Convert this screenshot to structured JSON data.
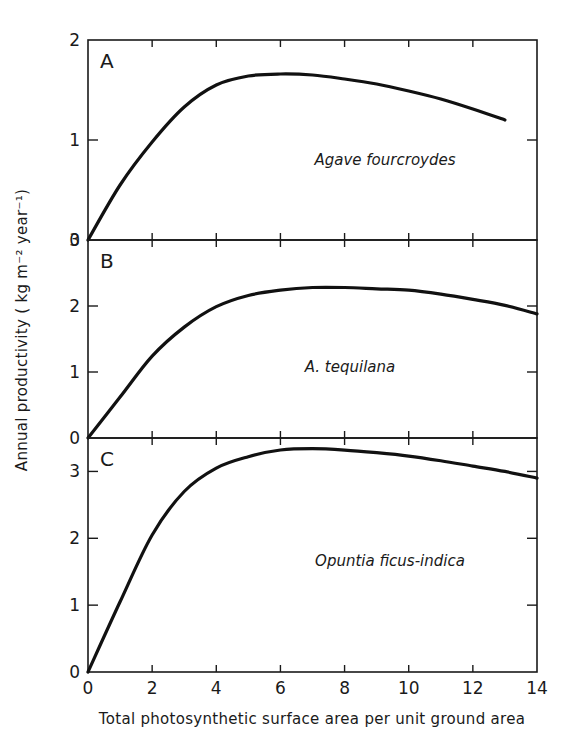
{
  "chart_data": [
    {
      "type": "line",
      "panel": "A",
      "title": "",
      "annotation": "Agave fourcroydes",
      "xlabel": "Total photosynthetic surface area per unit ground area",
      "ylabel": "Annual productivity (kg m^-2 year^-1)",
      "xlim": [
        0,
        14
      ],
      "ylim": [
        0,
        2
      ],
      "yticks": [
        0,
        1,
        2
      ],
      "x": [
        0,
        1,
        2,
        3,
        4,
        5,
        6,
        7,
        8,
        9,
        10,
        11,
        12,
        13
      ],
      "series": [
        {
          "name": "Agave fourcroydes",
          "values": [
            0,
            0.55,
            0.98,
            1.33,
            1.55,
            1.64,
            1.66,
            1.65,
            1.61,
            1.56,
            1.49,
            1.41,
            1.31,
            1.2
          ]
        }
      ]
    },
    {
      "type": "line",
      "panel": "B",
      "title": "",
      "annotation": "A. tequilana",
      "xlim": [
        0,
        14
      ],
      "ylim": [
        0,
        3
      ],
      "yticks": [
        0,
        1,
        2,
        3
      ],
      "x": [
        0,
        1,
        2,
        3,
        4,
        5,
        6,
        7,
        8,
        9,
        10,
        11,
        12,
        13,
        14
      ],
      "series": [
        {
          "name": "A. tequilana",
          "values": [
            0,
            0.62,
            1.24,
            1.68,
            1.99,
            2.16,
            2.24,
            2.28,
            2.28,
            2.26,
            2.24,
            2.18,
            2.1,
            2.01,
            1.88
          ]
        }
      ]
    },
    {
      "type": "line",
      "panel": "C",
      "title": "",
      "annotation": "Opuntia ficus-indica",
      "xlim": [
        0,
        14
      ],
      "ylim": [
        0,
        3.5
      ],
      "yticks": [
        0,
        1,
        2,
        3
      ],
      "xticks": [
        0,
        2,
        4,
        6,
        8,
        10,
        12,
        14
      ],
      "x": [
        0,
        1,
        2,
        3,
        4,
        5,
        6,
        7,
        8,
        9,
        10,
        11,
        12,
        13,
        14
      ],
      "series": [
        {
          "name": "Opuntia ficus-indica",
          "values": [
            0,
            1.05,
            2.05,
            2.7,
            3.05,
            3.22,
            3.32,
            3.34,
            3.32,
            3.28,
            3.23,
            3.16,
            3.08,
            3.0,
            2.9
          ]
        }
      ]
    }
  ],
  "axes": {
    "ylabel": "Annual productivity ( kg m⁻² year⁻¹)",
    "xlabel": "Total photosynthetic surface area per unit ground area",
    "xtick_labels": [
      "0",
      "2",
      "4",
      "6",
      "8",
      "10",
      "12",
      "14"
    ]
  },
  "panels": [
    {
      "letter": "A",
      "species": "Agave fourcroydes",
      "ytick_labels": [
        "0",
        "1",
        "2"
      ]
    },
    {
      "letter": "B",
      "species": "A. tequilana",
      "ytick_labels": [
        "0",
        "1",
        "2",
        "3"
      ]
    },
    {
      "letter": "C",
      "species": "Opuntia ficus-indica",
      "ytick_labels": [
        "0",
        "1",
        "2",
        "3"
      ]
    }
  ]
}
